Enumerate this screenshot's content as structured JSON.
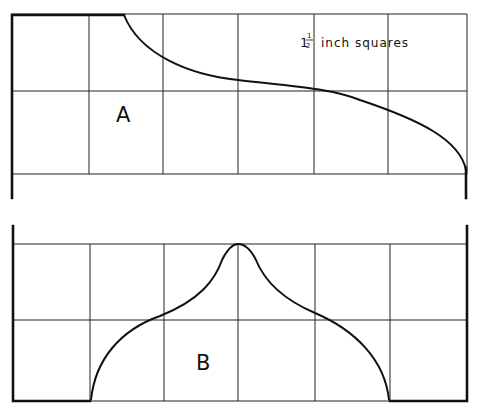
{
  "figure": {
    "scale_note": {
      "whole": "1",
      "fraction_num": "1",
      "fraction_den": "2",
      "text": "inch squares"
    },
    "pattern_a": {
      "label": "A"
    },
    "pattern_b": {
      "label": "B"
    },
    "grid": {
      "columns": 6,
      "rows": 2,
      "square_size": "1 1/2 inch"
    },
    "colors": {
      "line": "#111111",
      "background": "#ffffff"
    }
  }
}
